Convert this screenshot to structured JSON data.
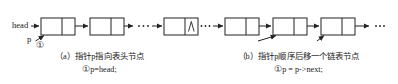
{
  "figure": {
    "type": "linked-list-pointer-traversal-diagram",
    "panels": [
      {
        "id": "a",
        "labels": {
          "head": "head",
          "pointer": "p",
          "step_marker": "①",
          "null_symbol": "∧"
        },
        "nodes": 3,
        "ellipsis": "…",
        "caption_line1": "（a）指针p指向表头节点",
        "caption_marker": "①",
        "caption_code": "p=head;"
      },
      {
        "id": "b",
        "labels": {
          "deref": "*p",
          "pointer_before": "p",
          "pointer_after": "p",
          "step_marker": "①"
        },
        "nodes": 3,
        "ellipsis_left": "…",
        "ellipsis_right": "…",
        "caption_line1": "（b）指针p顺序后移一个链表节点",
        "caption_marker": "①",
        "caption_code": "p = p->next;"
      }
    ],
    "colors": {
      "stroke": "#222222",
      "text": "#1a1a1a",
      "background": "#ffffff"
    }
  }
}
